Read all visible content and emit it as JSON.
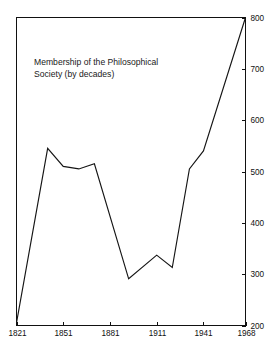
{
  "chart_data": {
    "type": "line",
    "title": "Membership of the Philosophical Society (by decades)",
    "title_line1": "Membership of the Philosophical",
    "title_line2": "Society (by decades)",
    "xlabel": "",
    "ylabel": "",
    "grid": false,
    "legend": "none",
    "y_axis_position": "right",
    "xlim": [
      1821,
      1968
    ],
    "ylim": [
      200,
      800
    ],
    "y_ticks": [
      200,
      300,
      400,
      500,
      600,
      700,
      800
    ],
    "y_tick_labels": [
      "200",
      "300",
      "400",
      "500",
      "600",
      "700",
      "800"
    ],
    "x_ticks": [
      1821,
      1851,
      1881,
      1911,
      1941,
      1968
    ],
    "x_tick_labels": [
      "1821",
      "1851",
      "1881",
      "1911",
      "1941",
      "1968"
    ],
    "series": [
      {
        "name": "Membership",
        "x": [
          1821,
          1841,
          1851,
          1861,
          1871,
          1893,
          1911,
          1921,
          1932,
          1941,
          1968
        ],
        "values": [
          205,
          545,
          510,
          505,
          515,
          291,
          337,
          313,
          505,
          540,
          800
        ]
      }
    ],
    "colors": {
      "line": "#151515",
      "axis": "#111111",
      "text": "#111111",
      "background": "#ffffff"
    }
  }
}
